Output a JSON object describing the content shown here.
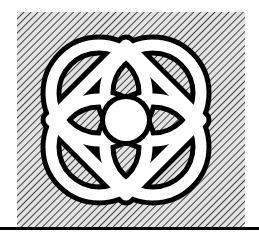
{
  "figure": {
    "width": 259,
    "height": 240,
    "background_color": "#ffffff"
  },
  "panel": {
    "name": "hatched-square-panel",
    "x": 17,
    "y": 12,
    "width": 228,
    "height": 216,
    "fill_color": "#e3e3e3",
    "hatch": {
      "direction": "diagonal-down-right",
      "angle_degrees": 45,
      "spacing_px": 5,
      "line_width_px": 1.6,
      "line_color": "#1a1a1a"
    }
  },
  "emblem": {
    "name": "atom-flower-emblem",
    "band_fill_color": "#ffffff",
    "outline_color": "#000000",
    "outline_width_px": 5,
    "center": {
      "x": 126,
      "y": 120
    },
    "lobes": [
      {
        "name": "lobe-top-left",
        "cx": 99,
        "cy": 93,
        "r": 48
      },
      {
        "name": "lobe-top-right",
        "cx": 153,
        "cy": 93,
        "r": 48
      },
      {
        "name": "lobe-bottom-left",
        "cx": 99,
        "cy": 147,
        "r": 48
      },
      {
        "name": "lobe-bottom-right",
        "cx": 153,
        "cy": 147,
        "r": 48
      }
    ],
    "diamond": {
      "name": "diamond-outline",
      "half_diagonal_x": 75,
      "half_diagonal_y": 75,
      "band_width_px": 11
    },
    "nucleus": {
      "name": "nucleus-circle",
      "cx": 126,
      "cy": 120,
      "r": 21,
      "fill_color": "#ffffff",
      "outline_color": "#000000"
    }
  },
  "rule": {
    "name": "horizontal-rule",
    "x": 0,
    "y": 227,
    "width": 259,
    "height": 3,
    "color": "#000000"
  }
}
